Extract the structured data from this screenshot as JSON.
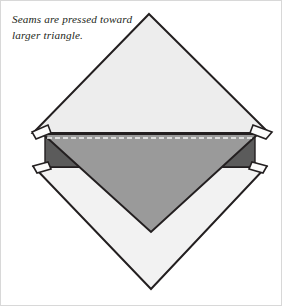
{
  "figure": {
    "caption": "Seams are pressed toward\nlarger triangle.",
    "background_color": "#ffffff",
    "border_color": "#d8d8d8"
  },
  "colors": {
    "outline": "#231f20",
    "light_fabric": "#ededed",
    "pale_fabric": "#f2f2f2",
    "medium_fabric": "#9a9a9a",
    "dark_shadow": "#5b5b5b",
    "seam_allowance": "#fbfbfb",
    "stitch_line": "#f5f5f5",
    "text": "#231f20"
  },
  "shapes": [
    {
      "name": "upper-large-triangle",
      "label": "Upper large triangle",
      "fill": "#ededed",
      "points": "148,13 268,132 32,132"
    },
    {
      "name": "lower-large-triangle",
      "label": "Lower large triangle",
      "fill": "#f2f2f2",
      "points": "33,166 265,166 150,288"
    },
    {
      "name": "left-dark-shadow-triangle",
      "label": "Left dark shadow triangle",
      "fill": "#5b5b5b",
      "points": "47,140 84,166 47,166"
    },
    {
      "name": "right-dark-shadow-triangle",
      "label": "Right dark shadow triangle",
      "fill": "#5b5b5b",
      "points": "250,140 250,166 213,166"
    },
    {
      "name": "medium-gray-triangle",
      "label": "Medium gray pieced triangle",
      "fill": "#9a9a9a",
      "points": "42,134 257,134 150,231"
    },
    {
      "name": "left-upper-seam-flap",
      "label": "Left upper seam allowance flap",
      "fill": "#fbfbfb",
      "points": "32,131 46,124 48,133 35,138"
    },
    {
      "name": "right-upper-seam-flap",
      "label": "Right upper seam allowance flap",
      "fill": "#fbfbfb",
      "points": "270,131 253,124 251,133 266,138"
    },
    {
      "name": "left-lower-seam-flap",
      "label": "Left lower seam allowance flap",
      "fill": "#fbfbfb",
      "points": "33,165 46,162 48,169 36,171"
    },
    {
      "name": "right-lower-seam-flap",
      "label": "Right lower seam allowance flap",
      "fill": "#fbfbfb",
      "points": "265,165 251,162 249,169 262,171"
    }
  ],
  "stitch_line": {
    "name": "dashed-stitch-line",
    "label": "Dashed stitching line",
    "color": "#f5f5f5",
    "dash_pattern": "5,3",
    "x1": 46,
    "y1": 136,
    "x2": 253,
    "y2": 136
  }
}
